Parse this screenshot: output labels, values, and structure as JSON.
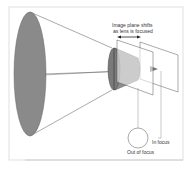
{
  "diagram": {
    "labels": {
      "shift_line1": "Image plane shifts",
      "shift_line2": "as lens is focused",
      "in_focus": "In focus",
      "out_of_focus": "Out of focus"
    },
    "colors": {
      "fill": "#8a8a8a",
      "line": "#555555",
      "frame": "#cccccc"
    }
  }
}
